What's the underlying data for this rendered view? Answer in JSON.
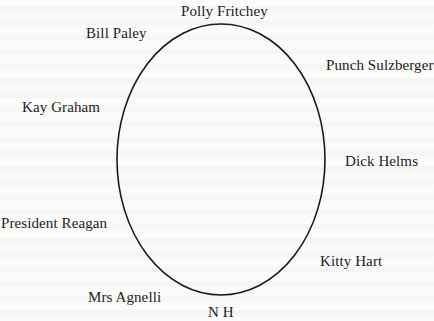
{
  "diagram": {
    "type": "ellipse-seating-chart",
    "shape": {
      "kind": "ellipse",
      "cx": 221,
      "cy": 159.5,
      "rx": 104,
      "ry": 135.5,
      "stroke": "#1a1a1a"
    },
    "labels": {
      "top": "Polly Fritchey",
      "top_left": "Bill Paley",
      "top_right": "Punch Sulzberger",
      "left_upper": "Kay Graham",
      "right_middle": "Dick Helms",
      "left_lower": "President Reagan",
      "right_lower": "Kitty Hart",
      "bottom_left": "Mrs Agnelli",
      "bottom": "N H"
    }
  },
  "colors": {
    "background": "#fbfbfa",
    "text": "#1e1e1e",
    "line": "#1a1a1a"
  }
}
